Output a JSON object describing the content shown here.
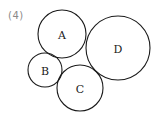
{
  "problem": {
    "label": "(4)"
  },
  "diagram": {
    "circles": [
      {
        "id": "A",
        "label": "A",
        "cx": 62,
        "cy": 34,
        "r": 24
      },
      {
        "id": "B",
        "label": "B",
        "cx": 45,
        "cy": 70,
        "r": 17
      },
      {
        "id": "C",
        "label": "C",
        "cx": 80,
        "cy": 88,
        "r": 23
      },
      {
        "id": "D",
        "label": "D",
        "cx": 118,
        "cy": 48,
        "r": 32
      }
    ],
    "stroke_color": "#1a1a1a"
  }
}
